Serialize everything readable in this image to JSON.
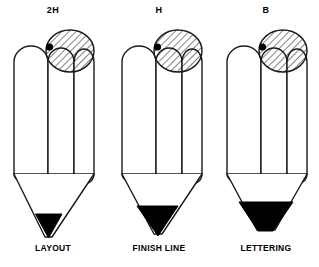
{
  "figure": {
    "title_text": "",
    "background_color": "#ffffff",
    "stroke_color": "#1a1a1a",
    "graphite_color": "#000000",
    "eraser_hatch_color": "#1a1a1a",
    "pencils": [
      {
        "grade_label": "2H",
        "use_label": "LAYOUT",
        "eraser_icon": "hatched-circle-eraser-icon",
        "tip_description": "sharp-fine-point",
        "graphite_width": 26,
        "graphite_height": 34
      },
      {
        "grade_label": "H",
        "use_label": "FINISH LINE",
        "eraser_icon": "hatched-circle-eraser-icon",
        "tip_description": "medium-point",
        "graphite_width": 38,
        "graphite_height": 32
      },
      {
        "grade_label": "B",
        "use_label": "LETTERING",
        "eraser_icon": "hatched-circle-eraser-icon",
        "tip_description": "blunt-broad-point",
        "graphite_width": 50,
        "graphite_height": 28
      }
    ]
  }
}
